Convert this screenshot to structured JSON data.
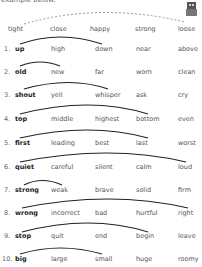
{
  "header": {
    "text": "example below."
  },
  "example": {
    "words": [
      "tight",
      "close",
      "happy",
      "strong",
      "loose"
    ],
    "arc": "dashed"
  },
  "rows": [
    {
      "num": "1.",
      "key": "up",
      "options": [
        "high",
        "down",
        "near",
        "above"
      ],
      "answer": "down"
    },
    {
      "num": "2.",
      "key": "old",
      "options": [
        "new",
        "far",
        "worn",
        "clean"
      ],
      "answer": "new"
    },
    {
      "num": "3.",
      "key": "shout",
      "options": [
        "yell",
        "whisper",
        "ask",
        "cry"
      ],
      "answer": "whisper"
    },
    {
      "num": "4.",
      "key": "top",
      "options": [
        "middle",
        "highest",
        "bottom",
        "even"
      ],
      "answer": "bottom"
    },
    {
      "num": "5.",
      "key": "first",
      "options": [
        "leading",
        "best",
        "last",
        "worst"
      ],
      "answer": "last"
    },
    {
      "num": "6.",
      "key": "quiet",
      "options": [
        "careful",
        "silent",
        "calm",
        "loud"
      ],
      "answer": "loud"
    },
    {
      "num": "7.",
      "key": "strong",
      "options": [
        "weak",
        "brave",
        "solid",
        "firm"
      ],
      "answer": "weak"
    },
    {
      "num": "8.",
      "key": "wrong",
      "options": [
        "incorrect",
        "bad",
        "hurtful",
        "right"
      ],
      "answer": "right"
    },
    {
      "num": "9.",
      "key": "stop",
      "options": [
        "quit",
        "end",
        "begin",
        "leave"
      ],
      "answer": "begin"
    },
    {
      "num": "10.",
      "key": "big",
      "options": [
        "large",
        "small",
        "huge",
        "roomy"
      ],
      "answer": "small"
    }
  ]
}
